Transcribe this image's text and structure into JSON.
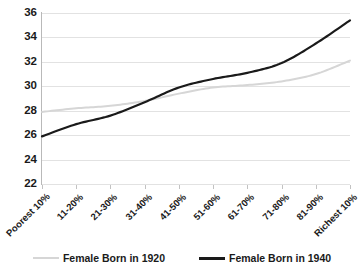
{
  "chart_data": {
    "type": "line",
    "title": "",
    "subtitle": "",
    "xlabel": "",
    "ylabel": "",
    "categories": [
      "Poorest 10%",
      "11-20%",
      "21-30%",
      "31-40%",
      "41-50%",
      "51-60%",
      "61-70%",
      "71-80%",
      "81-90%",
      "Richest 10%"
    ],
    "series": [
      {
        "name": "Female Born in 1920",
        "color": "#d6d6d6",
        "values": [
          27.9,
          28.2,
          28.4,
          28.8,
          29.4,
          29.9,
          30.1,
          30.4,
          31.0,
          32.1
        ]
      },
      {
        "name": "Female Born in 1940",
        "color": "#1a1a1a",
        "values": [
          25.9,
          26.9,
          27.6,
          28.7,
          29.9,
          30.6,
          31.1,
          31.9,
          33.5,
          35.4
        ]
      }
    ],
    "ylim": [
      22,
      36
    ],
    "yticks": [
      22,
      24,
      26,
      28,
      30,
      32,
      34,
      36
    ],
    "ytick_labels": [
      "22",
      "24",
      "26",
      "28",
      "30",
      "32",
      "34",
      "36"
    ],
    "grid": true,
    "grid_axis": "y",
    "legend_position": "bottom"
  },
  "legend": {
    "entries": [
      {
        "label": "Female Born in 1920",
        "marker": "gray-line-swatch"
      },
      {
        "label": "Female Born in 1940",
        "marker": "black-line-swatch"
      }
    ]
  }
}
